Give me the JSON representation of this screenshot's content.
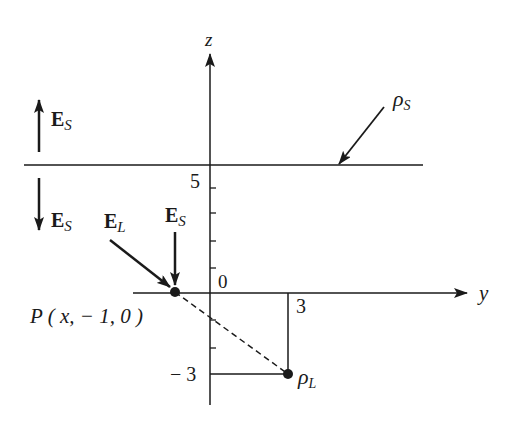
{
  "diagram": {
    "title": "",
    "axes": {
      "z_label": "z",
      "y_label": "y",
      "origin_label": "0",
      "z_tick_label_top": "5",
      "z_tick_label_bottom": "− 3",
      "y_tick_label": "3"
    },
    "plane": {
      "label": "ρ",
      "label_sub": "S",
      "height_z": 5
    },
    "line_charge": {
      "label": "ρ",
      "label_sub": "L",
      "y": 3,
      "z": -3
    },
    "point": {
      "label": "P ( x, − 1, 0 )",
      "y": -1,
      "z": 0
    },
    "field_labels": {
      "es_above": {
        "main": "E",
        "sub": "S"
      },
      "es_below": {
        "main": "E",
        "sub": "S"
      },
      "el_at_p": {
        "main": "E",
        "sub": "L"
      },
      "es_at_p": {
        "main": "E",
        "sub": "S"
      }
    },
    "colors": {
      "ink": "#1a1a1a",
      "background": "#ffffff"
    }
  }
}
